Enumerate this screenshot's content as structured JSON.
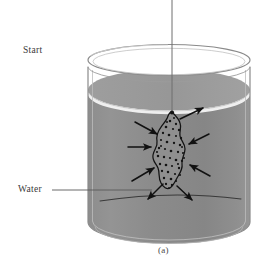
{
  "figure": {
    "caption": "(a)",
    "title_labels": {
      "start": "Start",
      "water": "Water"
    },
    "colors": {
      "background": "#ffffff",
      "water_body": "#8b8b8b",
      "water_surface": "#9a9a9a",
      "water_highlight": "#f2f2f2",
      "glass_outline": "#8e8e8e",
      "ink": "#1a1a1a",
      "label_text": "#3a3a3a",
      "blob_fill": "#8f8f8f",
      "speckle": "#141414"
    },
    "geometry": {
      "beaker_left": 88,
      "beaker_right": 250,
      "beaker_top": 52,
      "beaker_bottom": 243,
      "water_line_y": 90,
      "rim_ellipse_ry": 15,
      "blob_center_x": 172,
      "blob_center_y": 150
    },
    "elements": {
      "string": "vertical-string",
      "tablet": "dissolving-tablet",
      "arrow_count": 8,
      "speckle_count": 44
    },
    "leader_line": {
      "from_x": 52,
      "to_x": 152,
      "y": 190
    }
  }
}
